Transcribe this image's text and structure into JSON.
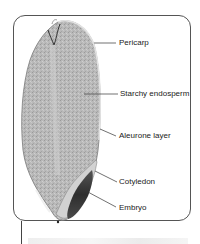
{
  "figure": {
    "labels": [
      {
        "id": "pericarp",
        "text": "Pericarp"
      },
      {
        "id": "starchy-endosperm",
        "text": "Starchy endosperm"
      },
      {
        "id": "aleurone-layer",
        "text": "Aleurone layer"
      },
      {
        "id": "cotyledon",
        "text": "Cotyledon"
      },
      {
        "id": "embryo",
        "text": "Embryo"
      }
    ]
  },
  "colors": {
    "frame": "#555555",
    "endosperm": "#b8b8b8",
    "embryo": "#3a3a3a",
    "leader_lines": "#333333",
    "label_text": "#222222"
  }
}
